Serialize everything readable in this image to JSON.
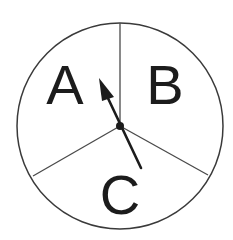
{
  "diagram": {
    "type": "spinner",
    "sections": [
      {
        "id": "A",
        "label": "A"
      },
      {
        "id": "B",
        "label": "B"
      },
      {
        "id": "C",
        "label": "C"
      }
    ],
    "pointer": {
      "points_to": "A"
    },
    "colors": {
      "stroke": "#3a3a3a",
      "arrow": "#1c1c1c",
      "text": "#1c1c1c",
      "background": "#ffffff"
    }
  }
}
